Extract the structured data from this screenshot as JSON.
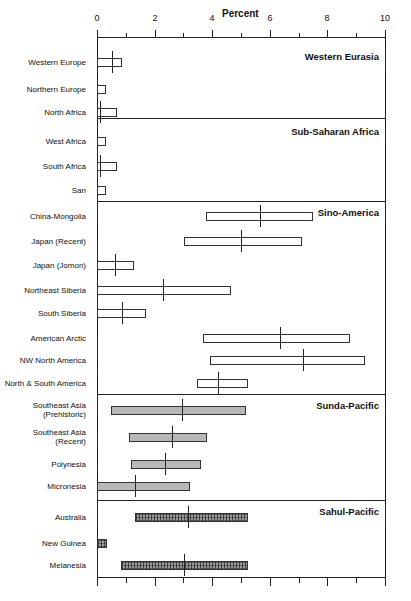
{
  "chart_data": {
    "type": "bar",
    "title": "",
    "xlabel": "Percent",
    "ylabel": "",
    "xlim": [
      0,
      10
    ],
    "xticks_major": [
      0,
      2,
      4,
      6,
      8,
      10
    ],
    "xticks_minor": [
      1,
      3,
      5,
      7,
      9
    ],
    "grid": false,
    "legend": "none",
    "orientation": "horizontal",
    "groups": [
      {
        "name": "Western Eurasia",
        "style": "open",
        "categories": [
          {
            "label": "Western Europe",
            "low": 0.0,
            "high": 0.87,
            "mean": 0.52
          },
          {
            "label": "Northern Europe",
            "low": 0.0,
            "high": 0.3,
            "mean": null
          },
          {
            "label": "North Africa",
            "low": 0.0,
            "high": 0.7,
            "mean": 0.1
          }
        ]
      },
      {
        "name": "Sub-Saharan Africa",
        "style": "open",
        "categories": [
          {
            "label": "West Africa",
            "low": 0.0,
            "high": 0.3,
            "mean": null
          },
          {
            "label": "South Africa",
            "low": 0.0,
            "high": 0.7,
            "mean": 0.1
          },
          {
            "label": "San",
            "low": 0.0,
            "high": 0.3,
            "mean": null
          }
        ]
      },
      {
        "name": "Sino-America",
        "style": "open",
        "categories": [
          {
            "label": "China-Mongolia",
            "low": 3.8,
            "high": 7.5,
            "mean": 5.66
          },
          {
            "label": "Japan (Recent)",
            "low": 3.02,
            "high": 7.12,
            "mean": 5.0
          },
          {
            "label": "Japan (Jomon)",
            "low": 0.0,
            "high": 1.28,
            "mean": 0.62
          },
          {
            "label": "Northeast Siberia",
            "low": 0.0,
            "high": 4.65,
            "mean": 2.29
          },
          {
            "label": "South Siberia",
            "low": 0.0,
            "high": 1.7,
            "mean": 0.87
          }
        ]
      },
      {
        "name": "Sino-America",
        "style": "open",
        "continued": true,
        "categories": [
          {
            "label": "American Arctic",
            "low": 3.68,
            "high": 8.78,
            "mean": 6.35
          },
          {
            "label": "NW North America",
            "low": 3.92,
            "high": 9.3,
            "mean": 7.15
          },
          {
            "label": "North & South America",
            "low": 3.47,
            "high": 5.24,
            "mean": 4.2
          }
        ]
      },
      {
        "name": "Sunda-Pacific",
        "style": "shaded",
        "categories": [
          {
            "label": "Southeast Asia (Prehistoric)",
            "low": 0.49,
            "high": 5.17,
            "mean": 2.95
          },
          {
            "label": "Southeast Asia (Recent)",
            "low": 1.11,
            "high": 3.82,
            "mean": 2.6
          },
          {
            "label": "Polynesia",
            "low": 1.18,
            "high": 3.61,
            "mean": 2.36
          },
          {
            "label": "Micronesia",
            "low": 0.0,
            "high": 3.23,
            "mean": 1.32
          }
        ]
      },
      {
        "name": "Sahul-Pacific",
        "style": "hatched",
        "categories": [
          {
            "label": "Australia",
            "low": 1.32,
            "high": 5.24,
            "mean": 3.16
          },
          {
            "label": "New Guinea",
            "low": 0.0,
            "high": 0.35,
            "mean": null
          },
          {
            "label": "Melanesia",
            "low": 0.83,
            "high": 5.24,
            "mean": 3.02
          }
        ]
      }
    ]
  },
  "axis": {
    "title": "Percent",
    "tick_labels": [
      "0",
      "2",
      "4",
      "6",
      "8",
      "10"
    ]
  },
  "panel_labels": [
    "Western Eurasia",
    "Sub-Saharan Africa",
    "Sino-America",
    "Sunda-Pacific",
    "Sahul-Pacific"
  ],
  "category_labels": [
    "Western Europe",
    "Northern Europe",
    "North Africa",
    "West Africa",
    "South Africa",
    "San",
    "China-Mongolia",
    "Japan (Recent)",
    "Japan (Jomon)",
    "Northeast Siberia",
    "South Siberia",
    "American Arctic",
    "NW North America",
    "North & South America",
    "Southeast Asia (Prehistoric)",
    "Southeast Asia (Recent)",
    "Polynesia",
    "Micronesia",
    "Australia",
    "New Guinea",
    "Melanesia"
  ]
}
